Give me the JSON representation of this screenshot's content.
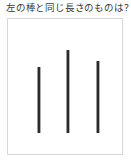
{
  "page": {
    "width": 131,
    "height": 161,
    "background_color": "#ffffff"
  },
  "question": {
    "text": "左の棒と同じ長さのものは？"
  },
  "stimulus_box": {
    "border_color": "#d7d7d7",
    "background_color": "#ffffff",
    "x": 7,
    "y": 18,
    "width": 116,
    "height": 137
  },
  "bars": [
    {
      "id": "bar-left",
      "label": "left bar",
      "color": "#2b2b2b",
      "x": 38,
      "top": 67,
      "bottom": 133,
      "length": 66,
      "thickness": 2
    },
    {
      "id": "bar-middle",
      "label": "middle bar",
      "color": "#2b2b2b",
      "x": 67,
      "top": 50,
      "bottom": 133,
      "length": 83,
      "thickness": 2
    },
    {
      "id": "bar-right",
      "label": "right bar",
      "color": "#2b2b2b",
      "x": 97,
      "top": 61,
      "bottom": 133,
      "length": 72,
      "thickness": 2
    }
  ]
}
